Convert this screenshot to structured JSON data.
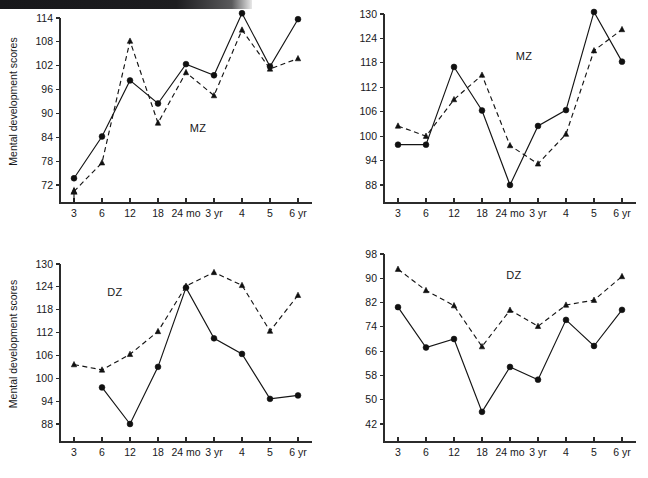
{
  "figure": {
    "panels": [
      "top-left",
      "top-right",
      "bottom-left",
      "bottom-right"
    ],
    "axis_title": "Mental development scores",
    "x_categories": [
      "3",
      "6",
      "12",
      "18",
      "24 mo",
      "3 yr",
      "4",
      "5",
      "6 yr"
    ]
  },
  "chart_data": [
    {
      "id": "top-left",
      "type": "line",
      "title": "",
      "annotation": "MZ",
      "xlabel": "",
      "ylabel": "Mental development scores",
      "categories": [
        "3",
        "6",
        "12",
        "18",
        "24 mo",
        "3 yr",
        "4",
        "5",
        "6 yr"
      ],
      "yticks": [
        72,
        78,
        84,
        90,
        96,
        102,
        108,
        114
      ],
      "ylim": [
        69,
        116
      ],
      "grid": false,
      "legend": "none",
      "series": [
        {
          "name": "twin-a",
          "style": "solid",
          "marker": "circle",
          "values": [
            73.7,
            84.2,
            98.3,
            92.5,
            102.4,
            99.6,
            115.2,
            101.8,
            113.7
          ]
        },
        {
          "name": "twin-b",
          "style": "dashed",
          "marker": "triangle",
          "values": [
            70.4,
            77.6,
            108.2,
            87.6,
            100.3,
            94.5,
            111.0,
            101.2,
            103.8
          ]
        }
      ],
      "annotations": [
        {
          "text": "arrow-up",
          "x": "3"
        }
      ]
    },
    {
      "id": "top-right",
      "type": "line",
      "title": "",
      "annotation": "MZ",
      "xlabel": "",
      "ylabel": "",
      "categories": [
        "3",
        "6",
        "12",
        "18",
        "24 mo",
        "3 yr",
        "4",
        "5",
        "6 yr"
      ],
      "yticks": [
        88,
        94,
        100,
        106,
        112,
        118,
        124,
        130
      ],
      "ylim": [
        85,
        132
      ],
      "grid": false,
      "legend": "none",
      "series": [
        {
          "name": "twin-a",
          "style": "solid",
          "marker": "circle",
          "values": [
            97.9,
            97.9,
            117.0,
            106.3,
            88.0,
            102.5,
            106.4,
            130.5,
            118.3
          ]
        },
        {
          "name": "twin-b",
          "style": "dashed",
          "marker": "triangle",
          "values": [
            102.5,
            100.0,
            109.0,
            115.0,
            97.7,
            93.2,
            100.5,
            121.0,
            126.2
          ]
        }
      ],
      "annotations": []
    },
    {
      "id": "bottom-left",
      "type": "line",
      "title": "",
      "annotation": "DZ",
      "xlabel": "",
      "ylabel": "Mental development scores",
      "categories": [
        "3",
        "6",
        "12",
        "18",
        "24 mo",
        "3 yr",
        "4",
        "5",
        "6 yr"
      ],
      "yticks": [
        88,
        94,
        100,
        106,
        112,
        118,
        124,
        130
      ],
      "ylim": [
        85,
        132
      ],
      "grid": false,
      "legend": "none",
      "series": [
        {
          "name": "twin-a",
          "style": "solid",
          "marker": "circle",
          "values": [
            null,
            97.6,
            88.0,
            103.0,
            123.8,
            110.5,
            106.4,
            94.6,
            95.5
          ]
        },
        {
          "name": "twin-b",
          "style": "dashed",
          "marker": "triangle",
          "values": [
            103.6,
            102.2,
            106.3,
            112.3,
            124.2,
            127.8,
            124.4,
            112.4,
            121.8
          ]
        }
      ],
      "annotations": []
    },
    {
      "id": "bottom-right",
      "type": "line",
      "title": "",
      "annotation": "DZ",
      "xlabel": "",
      "ylabel": "",
      "categories": [
        "3",
        "6",
        "12",
        "18",
        "24 mo",
        "3 yr",
        "4",
        "5",
        "6 yr"
      ],
      "yticks": [
        42,
        50,
        58,
        66,
        74,
        82,
        90,
        98
      ],
      "ylim": [
        38,
        100
      ],
      "grid": false,
      "legend": "none",
      "series": [
        {
          "name": "twin-a",
          "style": "solid",
          "marker": "circle",
          "values": [
            80.5,
            67.2,
            70.0,
            46.0,
            60.8,
            56.6,
            76.3,
            67.7,
            79.6
          ]
        },
        {
          "name": "twin-b",
          "style": "dashed",
          "marker": "triangle",
          "values": [
            93.0,
            86.0,
            81.0,
            67.5,
            79.5,
            74.2,
            81.2,
            82.8,
            90.6
          ]
        }
      ],
      "annotations": []
    }
  ]
}
